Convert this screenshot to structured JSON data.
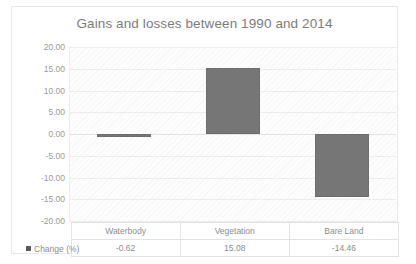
{
  "chart_data": {
    "type": "bar",
    "title": "Gains and losses between 1990 and 2014",
    "xlabel": "",
    "ylabel": "",
    "categories": [
      "Waterbody",
      "Vegetation",
      "Bare Land"
    ],
    "series": [
      {
        "name": "Change (%)",
        "values": [
          -0.62,
          15.08,
          -14.46
        ]
      }
    ],
    "value_labels": [
      "-0.62",
      "15.08",
      "-14.46"
    ],
    "ylim": [
      -20,
      20
    ],
    "ytick_step": 5,
    "ytick_labels": [
      "20.00",
      "15.00",
      "10.00",
      "5.00",
      "0.00",
      "-5.00",
      "-10.00",
      "-15.00",
      "-20.00"
    ],
    "ytick_values": [
      20,
      15,
      10,
      5,
      0,
      -5,
      -10,
      -15,
      -20
    ],
    "grid": true,
    "legend_position": "data-table-row",
    "bar_color": "#767676",
    "title_color": "#7c7c7c",
    "axis_text_color": "#9a9a9a",
    "has_data_table": true
  },
  "table": {
    "legend_label": "Change (%)"
  }
}
